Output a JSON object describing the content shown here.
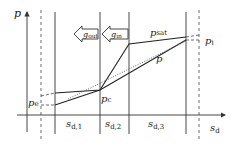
{
  "diagram": {
    "axes": {
      "y_label": "p",
      "x_label": "s",
      "x_label_sub": "d"
    },
    "segments": [
      {
        "label": "s",
        "sub": "d,1"
      },
      {
        "label": "s",
        "sub": "d,2"
      },
      {
        "label": "s",
        "sub": "d,3"
      }
    ],
    "arrows": [
      {
        "label": "g",
        "sub": "out"
      },
      {
        "label": "g",
        "sub": "in"
      }
    ],
    "curves": {
      "saturation": {
        "label": "p",
        "sub": "sat"
      },
      "pressure": {
        "label": "p"
      }
    },
    "points": {
      "pe": {
        "label": "p",
        "sub": "e"
      },
      "pc": {
        "label": "p",
        "sub": "c"
      },
      "pi": {
        "label": "p",
        "sub": "i"
      }
    },
    "colors": {
      "line": "#333333",
      "background": "#ffffff"
    }
  }
}
